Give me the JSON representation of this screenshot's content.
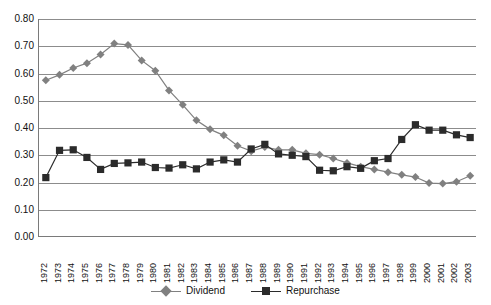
{
  "chart_data": {
    "type": "line",
    "title": "",
    "subtitle": "",
    "xlabel": "",
    "ylabel": "",
    "grid": true,
    "legend_position": "bottom-center",
    "ylim": [
      0.0,
      0.8
    ],
    "ytick_labels": [
      "0.80",
      "0.70",
      "0.60",
      "0.50",
      "0.40",
      "0.30",
      "0.20",
      "0.10",
      "0.00"
    ],
    "ytick_values": [
      0.8,
      0.7,
      0.6,
      0.5,
      0.4,
      0.3,
      0.2,
      0.1,
      0.0
    ],
    "categories": [
      "1972",
      "1973",
      "1974",
      "1975",
      "1976",
      "1977",
      "1978",
      "1979",
      "1980",
      "1981",
      "1982",
      "1983",
      "1984",
      "1985",
      "1986",
      "1987",
      "1988",
      "1989",
      "1990",
      "1991",
      "1992",
      "1993",
      "1994",
      "1995",
      "1996",
      "1997",
      "1998",
      "1999",
      "2000",
      "2001",
      "2002",
      "2003"
    ],
    "series": [
      {
        "name": "Dividend",
        "color": "#808080",
        "marker": "diamond",
        "values": [
          0.575,
          0.595,
          0.62,
          0.638,
          0.67,
          0.71,
          0.705,
          0.648,
          0.61,
          0.538,
          0.485,
          0.428,
          0.395,
          0.373,
          0.335,
          0.315,
          0.33,
          0.32,
          0.32,
          0.307,
          0.302,
          0.288,
          0.272,
          0.258,
          0.248,
          0.238,
          0.228,
          0.22,
          0.198,
          0.196,
          0.203,
          0.225
        ]
      },
      {
        "name": "Repurchase",
        "color": "#2b2b2b",
        "marker": "square",
        "values": [
          0.218,
          0.318,
          0.32,
          0.292,
          0.248,
          0.27,
          0.272,
          0.275,
          0.255,
          0.253,
          0.265,
          0.25,
          0.275,
          0.283,
          0.275,
          0.323,
          0.34,
          0.305,
          0.3,
          0.295,
          0.245,
          0.243,
          0.258,
          0.252,
          0.28,
          0.288,
          0.358,
          0.412,
          0.392,
          0.392,
          0.375,
          0.365
        ]
      }
    ]
  },
  "legend": {
    "entries": [
      {
        "label": "Dividend"
      },
      {
        "label": "Repurchase"
      }
    ]
  }
}
